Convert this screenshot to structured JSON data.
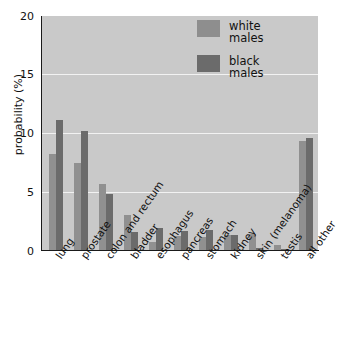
{
  "chart_data": {
    "type": "bar",
    "title": "",
    "xlabel": "",
    "ylabel": "probability (%)",
    "ylim": [
      0,
      20
    ],
    "yticks": [
      0,
      5,
      10,
      15,
      20
    ],
    "ytick_labels": [
      "0",
      "5",
      "10",
      "15",
      "20"
    ],
    "grid": "horizontal",
    "legend_position": "top-right",
    "categories": [
      "lung",
      "prostate",
      "colon and rectum",
      "bladder",
      "esophagus",
      "pancreas",
      "stomach",
      "kidney",
      "skin (melanoma)",
      "testis",
      "all other"
    ],
    "series": [
      {
        "name": "white males",
        "color": "#909090",
        "values": [
          8.2,
          7.4,
          5.6,
          3.0,
          0.7,
          1.2,
          1.1,
          1.3,
          1.4,
          0.4,
          9.3
        ]
      },
      {
        "name": "black males",
        "color": "#6b6b6b",
        "values": [
          11.1,
          10.2,
          4.8,
          1.5,
          1.9,
          1.6,
          1.7,
          1.3,
          0.2,
          0.1,
          9.6
        ]
      }
    ]
  },
  "legend": {
    "entries": [
      {
        "label_line1": "white",
        "label_line2": "males",
        "swatch": "white-males-swatch"
      },
      {
        "label_line1": "black",
        "label_line2": "males",
        "swatch": "black-males-swatch"
      }
    ]
  },
  "colors": {
    "plot_background": "#c9c9c9",
    "gridline": "#f2f2f2",
    "axis": "#1a1a1a",
    "white_males_bar": "#909090",
    "black_males_bar": "#6b6b6b",
    "page_background": "#ffffff",
    "text": "#111111"
  }
}
